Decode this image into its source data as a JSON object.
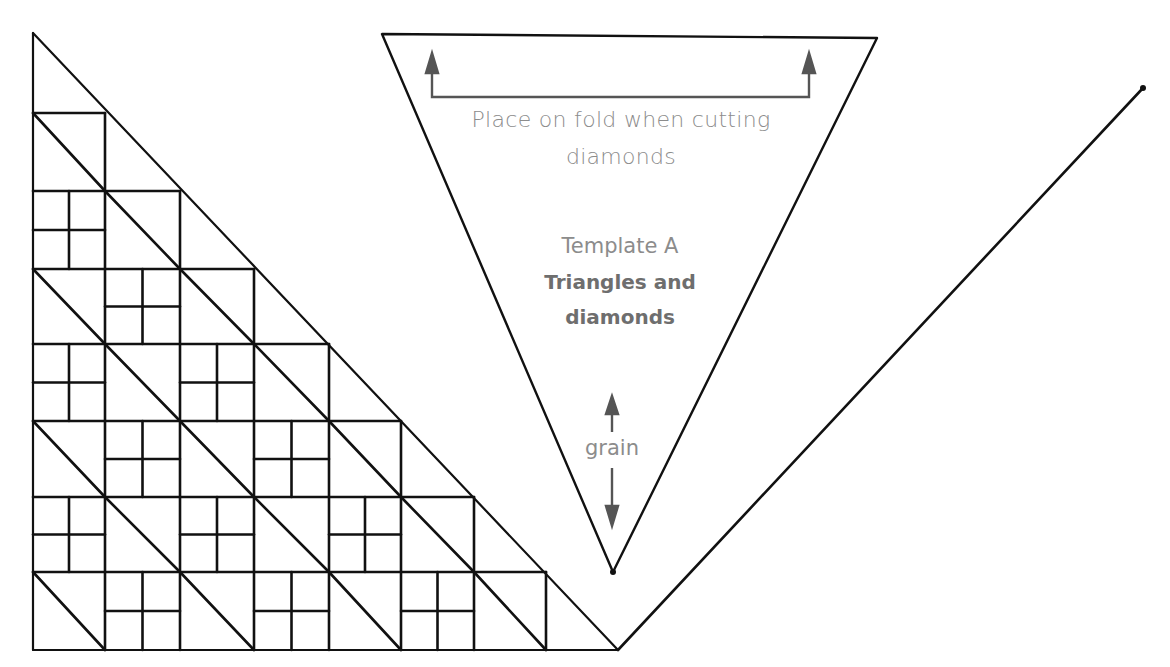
{
  "diagram": {
    "type": "quilt-template",
    "template": {
      "fold_instruction": [
        "Place on fold when cutting",
        "diamonds"
      ],
      "name": "Template A",
      "title": [
        "Triangles and",
        "diamonds"
      ],
      "grain_label": "grain",
      "outline": {
        "top_left": [
          382,
          34
        ],
        "top_right": [
          877,
          38
        ],
        "bottom": [
          613,
          572
        ]
      }
    },
    "quilt_grid": {
      "columns_x": [
        33,
        105,
        180,
        254,
        329,
        401,
        474,
        546,
        618
      ],
      "rows_y": [
        33,
        113,
        191,
        269,
        344,
        421,
        497,
        572,
        650
      ],
      "rule": "row r has r full blocks; block type = diagonal when (col-row) odd, four-patch cross when even; hypotenuse from apex to bottom-right",
      "apex": [
        33,
        33
      ],
      "corner": [
        618,
        650
      ]
    },
    "right_line": {
      "from": [
        618,
        650
      ],
      "to": [
        1143,
        88
      ]
    },
    "colors": {
      "line": "#111111",
      "text": "#8c8c8c",
      "title": "#6e6e6e",
      "arrow": "#555555",
      "background": "#ffffff"
    }
  }
}
